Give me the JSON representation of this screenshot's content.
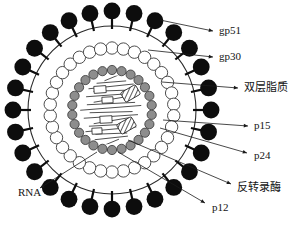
{
  "figure": {
    "background_color": "#ffffff",
    "width": 303,
    "height": 225
  },
  "labels": [
    {
      "id": "gp51",
      "text": "gp51",
      "lang": "en",
      "x": 219,
      "y": 31,
      "anchor_x": 213,
      "anchor_y": 31,
      "leader_from_x": 160,
      "leader_from_y": 20
    },
    {
      "id": "gp30",
      "text": "gp30",
      "lang": "en",
      "x": 219,
      "y": 57,
      "anchor_x": 213,
      "anchor_y": 57,
      "leader_from_x": 148,
      "leader_from_y": 50
    },
    {
      "id": "bilayer",
      "text": "双层脂质",
      "lang": "cn",
      "x": 244,
      "y": 88,
      "anchor_x": 238,
      "anchor_y": 88,
      "leader_from_x": 162,
      "leader_from_y": 82
    },
    {
      "id": "p15",
      "text": "p15",
      "lang": "en",
      "x": 254,
      "y": 126,
      "anchor_x": 248,
      "anchor_y": 126,
      "leader_from_x": 163,
      "leader_from_y": 120
    },
    {
      "id": "p24",
      "text": "p24",
      "lang": "en",
      "x": 254,
      "y": 156,
      "anchor_x": 247,
      "anchor_y": 153,
      "leader_from_x": 160,
      "leader_from_y": 128
    },
    {
      "id": "rt",
      "text": "反转录酶",
      "lang": "cn",
      "x": 237,
      "y": 188,
      "anchor_x": 231,
      "anchor_y": 184,
      "leader_from_x": 128,
      "leader_from_y": 140
    },
    {
      "id": "p12",
      "text": "p12",
      "lang": "en",
      "x": 212,
      "y": 208,
      "anchor_x": 205,
      "anchor_y": 203,
      "leader_from_x": 118,
      "leader_from_y": 152
    },
    {
      "id": "rna",
      "text": "RNA",
      "lang": "en",
      "x": 18,
      "y": 193,
      "anchor_x": 40,
      "anchor_y": 188,
      "leader_from_x": 97,
      "leader_from_y": 152
    }
  ],
  "structure": {
    "center_x": 112,
    "center_y": 110,
    "envelope_radius": 84,
    "spike_count": 28,
    "spike_head_radius": 8.4,
    "spike_stalk_length": 9,
    "bilayer_ring_radius": 62,
    "bilayer_bead_count": 34,
    "bilayer_bead_radius": 6.2,
    "capsid_ring_radius": 40,
    "capsid_bead_count": 26,
    "capsid_bead_radius": 4.6,
    "core_radius": 35
  },
  "colors": {
    "spike": "#0d0d0d",
    "envelope_line": "#2b2b2b",
    "bilayer_fill": "#ffffff",
    "bilayer_stroke": "#3a3a3a",
    "capsid_fill": "#8d8d8d",
    "capsid_stroke": "#343434",
    "core_line": "#232323",
    "label_text": "#141414",
    "background": "#ffffff"
  },
  "core_contents": {
    "rna_strand_count": 16,
    "enzyme_box_count": 4,
    "hatched_enzyme_count": 2,
    "description": "Linear RNA strands with reverse transcriptase boxes and hatched protein bodies"
  }
}
